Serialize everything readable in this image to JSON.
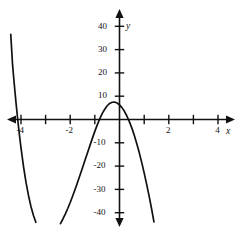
{
  "chart_data": {
    "type": "line",
    "title": "",
    "subtitle": "",
    "xlabel": "x",
    "ylabel": "y",
    "xlim": [
      -4.55,
      4.6
    ],
    "ylim": [
      -45,
      46
    ],
    "grid": false,
    "legend": null,
    "axis_style": "arrows-both-ends",
    "x_ticks": [
      -4,
      -3,
      -2,
      -1,
      1,
      2,
      3,
      4
    ],
    "x_tick_labels": [
      "-4",
      "",
      "-2",
      "",
      "",
      "2",
      "",
      "4"
    ],
    "y_ticks": [
      40,
      30,
      20,
      10,
      -10,
      -20,
      -30,
      -40
    ],
    "y_tick_labels": [
      "40",
      "30",
      "20",
      "10",
      "-10",
      "-20",
      "-30",
      "-40"
    ],
    "curve_color": "#111111",
    "axis_color": "#111111",
    "series": [
      {
        "name": "curve",
        "equation": "y = x^3 (x + 4)",
        "x": [
          -4.42,
          -4.35,
          -4.3,
          -4.25,
          -4.2,
          -4.15,
          -4.1,
          -4.05,
          -4.0,
          -3.9,
          -3.8,
          -3.7,
          -3.6,
          -3.5,
          -3.4,
          -3.3,
          -3.2,
          -3.1,
          -3.0,
          -2.9,
          -2.8,
          -2.7,
          -2.6,
          -2.5,
          -2.4,
          -2.3,
          -2.2,
          -2.1,
          -2.0,
          -1.9,
          -1.8,
          -1.7,
          -1.6,
          -1.5,
          -1.4,
          -1.3,
          -1.2,
          -1.1,
          -1.0,
          -0.9,
          -0.8,
          -0.7,
          -0.6,
          -0.5,
          -0.4,
          -0.3,
          -0.2,
          -0.1,
          0.0,
          0.1,
          0.2,
          0.3,
          0.4,
          0.5,
          0.6,
          0.7,
          0.8,
          0.9,
          1.0,
          1.1,
          1.2,
          1.3,
          1.4,
          1.5,
          1.6,
          1.7,
          1.8,
          1.9,
          2.0,
          2.05
        ],
        "y": [
          36.5,
          23.9,
          17.8,
          12.0,
          6.5,
          1.3,
          -3.6,
          -8.2,
          -12.5,
          -20.3,
          -27.0,
          -32.6,
          -37.3,
          -41.1,
          -44.1,
          -46.4,
          -48.1,
          -49.2,
          -49.8,
          -49.9,
          -49.6,
          -48.9,
          -47.8,
          -46.4,
          -44.7,
          -42.7,
          -40.5,
          -38.1,
          -35.5,
          -32.7,
          -29.8,
          -26.8,
          -23.7,
          -20.6,
          -17.4,
          -14.3,
          -11.1,
          -8.0,
          -5.0,
          -2.2,
          0.36,
          2.6,
          4.4,
          5.9,
          6.9,
          7.4,
          7.5,
          7.1,
          6.3,
          5.1,
          3.5,
          1.5,
          -0.9,
          -3.6,
          -6.8,
          -10.3,
          -14.1,
          -18.3,
          -22.8,
          -27.6,
          -32.7,
          -38.1,
          -43.9,
          -50.0,
          -56.4,
          -63.1,
          -70.1,
          -77.5,
          -85.2,
          -89.2
        ]
      }
    ],
    "features": {
      "local_minimum": {
        "x": -3.0,
        "y": -26
      },
      "roots_visible": [
        -4,
        0
      ],
      "inflection_near_origin": true,
      "left_branch_top_y": 45,
      "right_branch_top_y": 45
    }
  },
  "axes": {
    "x_axis_label": "x",
    "y_axis_label": "y"
  }
}
